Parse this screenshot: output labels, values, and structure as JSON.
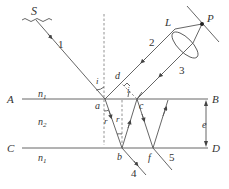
{
  "diagram": {
    "source_label": "S",
    "lens_label": "L",
    "point_label": "P",
    "interfaces": {
      "top_left": "A",
      "top_right": "B",
      "bottom_left": "C",
      "bottom_right": "D"
    },
    "media": {
      "above": "n",
      "above_sub": "1",
      "film": "n",
      "film_sub": "2",
      "below": "n",
      "below_sub": "1"
    },
    "points": {
      "a": "a",
      "b": "b",
      "c": "c",
      "d": "d",
      "f": "f"
    },
    "angles": {
      "incidence": "i",
      "incidence2": "i",
      "refraction": "r",
      "refraction2": "r"
    },
    "thickness_label": "e",
    "rays": [
      "1",
      "2",
      "3",
      "4",
      "5"
    ],
    "colors": {
      "line": "#555555",
      "text": "#333333",
      "background": "#ffffff"
    }
  }
}
